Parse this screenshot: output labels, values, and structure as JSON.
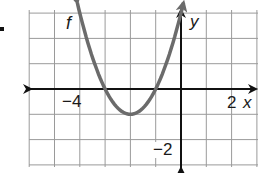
{
  "chart_data": {
    "type": "line",
    "title": "",
    "function_label": "f",
    "xlabel": "x",
    "ylabel": "y",
    "tick_labels": {
      "x": [
        "-4",
        "2"
      ],
      "y": [
        "-2"
      ]
    },
    "xlim": [
      -6,
      3
    ],
    "ylim": [
      -3,
      3
    ],
    "grid": true,
    "grid_step": 1,
    "series": [
      {
        "name": "f",
        "equation": "f(x) = (x + 2)^2 - 1",
        "vertex": [
          -2,
          -1
        ],
        "x_intercepts": [
          -3,
          -1
        ],
        "x": [
          -4.1,
          -3.5,
          -3,
          -2.5,
          -2,
          -1.5,
          -1,
          -0.5,
          0.1
        ],
        "y": [
          3.41,
          1.25,
          0,
          -0.75,
          -1,
          -0.75,
          0,
          1.25,
          3.41
        ],
        "color": "#6b6b6b",
        "arrows_both_ends": true
      }
    ]
  },
  "labels": {
    "f": "f",
    "y": "y",
    "x": "x",
    "x_neg4": "−4",
    "x_2": "2",
    "y_neg2": "−2"
  },
  "colors": {
    "grid": "#9a9a9a",
    "axis": "#111111",
    "curve": "#6b6b6b"
  }
}
